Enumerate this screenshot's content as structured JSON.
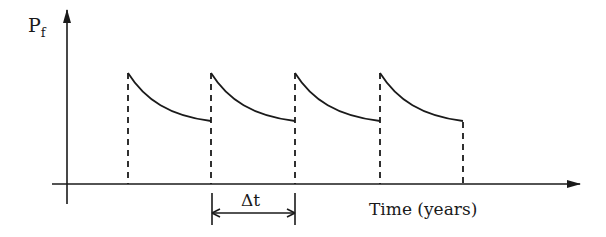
{
  "diagram": {
    "y_axis_label": "P",
    "y_axis_subscript": "f",
    "x_axis_label": "Time (years)",
    "interval_label": "Δt",
    "line_color": "#1a1a1a",
    "cycles": [
      {
        "start_x": 128,
        "end_x": 211
      },
      {
        "start_x": 211,
        "end_x": 295
      },
      {
        "start_x": 295,
        "end_x": 380
      },
      {
        "start_x": 380,
        "end_x": 463
      }
    ]
  }
}
